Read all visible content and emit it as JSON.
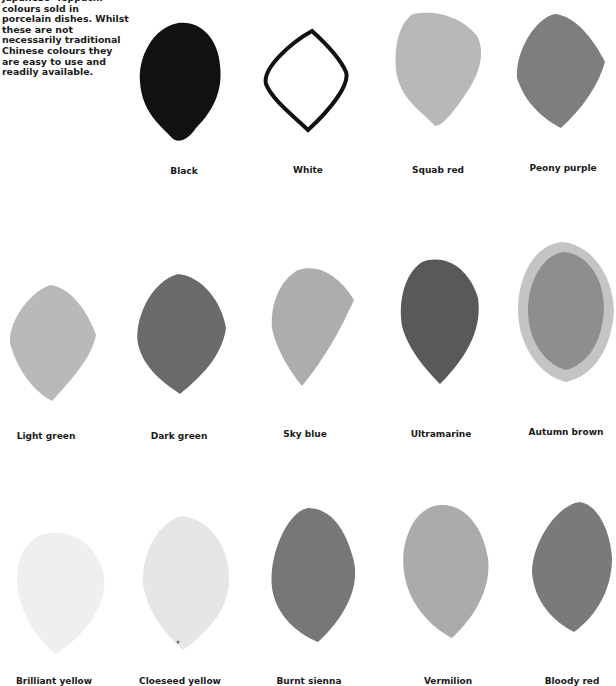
{
  "intro": {
    "lines": [
      "Japanese 'Teppachi'",
      "colours sold in",
      "porcelain dishes. Whilst",
      "these are not",
      "necessarily traditional",
      "Chinese colours they",
      "are easy to use and",
      "readily available."
    ]
  },
  "swatches": [
    {
      "label": "Black",
      "tone": "#111111"
    },
    {
      "label": "White",
      "tone": "outline"
    },
    {
      "label": "Squab red",
      "tone": "#b8b8b8"
    },
    {
      "label": "Peony purple",
      "tone": "#7e7e7e"
    },
    {
      "label": "Light green",
      "tone": "#b9b9b9"
    },
    {
      "label": "Dark green",
      "tone": "#6a6a6a"
    },
    {
      "label": "Sky blue",
      "tone": "#adadad"
    },
    {
      "label": "Ultramarine",
      "tone": "#595959"
    },
    {
      "label": "Autumn brown",
      "tone": "#999999"
    },
    {
      "label": "Brilliant yellow",
      "tone": "#efefef"
    },
    {
      "label": "Cloeseed yellow",
      "tone": "#e6e6e6"
    },
    {
      "label": "Burnt sienna",
      "tone": "#777777"
    },
    {
      "label": "Vermilion",
      "tone": "#ababab"
    },
    {
      "label": "Bloody red",
      "tone": "#7a7a7a"
    }
  ]
}
